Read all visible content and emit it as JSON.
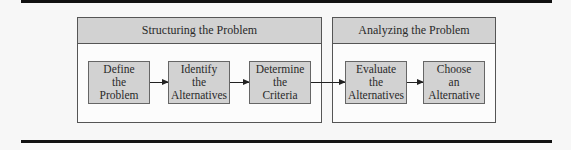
{
  "diagram": {
    "type": "process-flow",
    "phases": [
      {
        "label": "Structuring the Problem",
        "steps": [
          "Define\nthe\nProblem",
          "Identify\nthe\nAlternatives",
          "Determine\nthe\nCriteria"
        ]
      },
      {
        "label": "Analyzing the Problem",
        "steps": [
          "Evaluate\nthe\nAlternatives",
          "Choose\nan\nAlternative"
        ]
      }
    ],
    "edges": [
      [
        "Define the Problem",
        "Identify the Alternatives"
      ],
      [
        "Identify the Alternatives",
        "Determine the Criteria"
      ],
      [
        "Determine the Criteria",
        "Evaluate the Alternatives"
      ],
      [
        "Evaluate the Alternatives",
        "Choose an Alternative"
      ]
    ],
    "colors": {
      "box_fill": "#d2d2d2",
      "border": "#555555",
      "rule": "#111111"
    }
  }
}
